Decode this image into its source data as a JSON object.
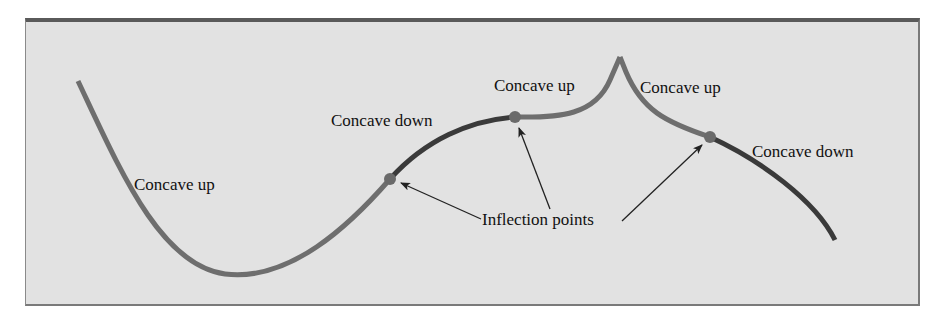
{
  "diagram": {
    "type": "concavity-illustration",
    "colors": {
      "background": "#e2e2e2",
      "frame_border": "#5a5a5a",
      "curve_concave_up": "#6e6e6e",
      "curve_concave_down": "#3a3a3a",
      "inflection_point": "#6a6a6a",
      "arrow": "#222222",
      "text": "#111111"
    },
    "labels": {
      "region_1": "Concave up",
      "region_2": "Concave down",
      "region_3": "Concave up",
      "region_4": "Concave up",
      "region_5": "Concave down",
      "callout": "Inflection points"
    },
    "inflection_points": [
      {
        "name": "inflection-point-1",
        "x": 390,
        "y": 179
      },
      {
        "name": "inflection-point-2",
        "x": 515,
        "y": 117
      },
      {
        "name": "inflection-point-3",
        "x": 710,
        "y": 137
      }
    ],
    "cusp": {
      "x": 620,
      "y": 57
    }
  }
}
